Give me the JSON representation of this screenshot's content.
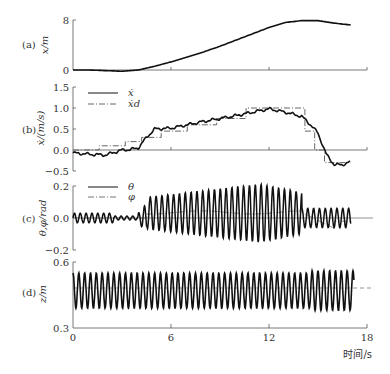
{
  "chart_data": [
    {
      "id": "a",
      "panel_label": "(a)",
      "type": "line",
      "ylabel": "x/m",
      "ylim": [
        0,
        8
      ],
      "yticks": [
        0,
        8
      ],
      "xlim": [
        0,
        18
      ],
      "series": [
        {
          "name": "x",
          "style": "solid",
          "x": [
            0,
            1,
            2,
            3,
            4,
            5,
            6,
            7,
            8,
            9,
            10,
            11,
            12,
            13,
            14,
            15,
            16,
            17
          ],
          "values": [
            0,
            0,
            -0.1,
            -0.2,
            0,
            0.6,
            1.3,
            2.1,
            2.9,
            3.8,
            4.8,
            5.8,
            6.8,
            7.6,
            7.9,
            7.9,
            7.5,
            7.2
          ]
        }
      ]
    },
    {
      "id": "b",
      "panel_label": "(b)",
      "type": "line",
      "ylabel": "ẋ/(m/s)",
      "ylim": [
        -0.5,
        1.5
      ],
      "yticks": [
        -0.5,
        0.0,
        0.5,
        1.0,
        1.5
      ],
      "xlim": [
        0,
        18
      ],
      "series": [
        {
          "name": "ẋ",
          "style": "solid",
          "x": [
            0,
            1,
            2,
            3,
            3.5,
            4,
            4.5,
            5,
            6,
            7,
            8,
            9,
            10,
            11,
            12,
            13,
            14,
            14.5,
            15,
            15.5,
            16,
            16.5,
            17
          ],
          "values": [
            -0.07,
            -0.1,
            -0.12,
            0.0,
            0.01,
            0.05,
            0.3,
            0.5,
            0.52,
            0.6,
            0.68,
            0.75,
            0.82,
            0.9,
            0.98,
            0.9,
            0.8,
            0.62,
            0.4,
            -0.1,
            -0.35,
            -0.35,
            -0.28
          ]
        },
        {
          "name": "ẋd",
          "style": "dashdot",
          "x": [
            0,
            1.6,
            1.6,
            3.2,
            3.2,
            4.2,
            4.2,
            5.4,
            5.4,
            7.0,
            7.0,
            8.8,
            8.8,
            10.6,
            10.6,
            14.2,
            14.2,
            14.8,
            14.8,
            15.4,
            15.4,
            17
          ],
          "values": [
            0,
            0,
            0.1,
            0.1,
            0.2,
            0.2,
            0.3,
            0.3,
            0.45,
            0.45,
            0.6,
            0.6,
            0.75,
            0.75,
            1.0,
            1.0,
            0.45,
            0.45,
            0.0,
            0.0,
            -0.3,
            -0.3
          ]
        }
      ]
    },
    {
      "id": "c",
      "panel_label": "(c)",
      "type": "line",
      "ylabel": "θ,φ/rad",
      "ylim": [
        -0.2,
        0.2
      ],
      "yticks": [
        -0.2,
        0.0,
        0.2
      ],
      "xlim": [
        0,
        18
      ],
      "series": [
        {
          "name": "θ",
          "style": "solid",
          "description": "small oscillation ~±0.03 for t<4s, growing oscillation reaching ~±0.18 around t=11-12s, decaying after t≈14s, irregular until t≈17s"
        },
        {
          "name": "φ",
          "style": "dashdot",
          "description": "slowly varying, near 0, rising to ~0.03-0.05 between 5 and 15s, dipping near 15.5s"
        }
      ]
    },
    {
      "id": "d",
      "panel_label": "(d)",
      "type": "line",
      "ylabel": "z/m",
      "ylim": [
        0.3,
        0.6
      ],
      "yticks": [
        0.3,
        0.6
      ],
      "xlim": [
        0,
        18
      ],
      "xticks": [
        0,
        6,
        12,
        18
      ],
      "xlabel": "时间/s",
      "series": [
        {
          "name": "z",
          "style": "solid",
          "description": "sinusoidal oscillation about 0.47 m with amplitude ~0.08 m (~2.8 Hz), 0 to ~17 s"
        },
        {
          "name": "z_ref",
          "style": "dashed",
          "values_const": 0.47
        }
      ]
    }
  ],
  "axes": {
    "x_ticks": [
      "0",
      "6",
      "12",
      "18"
    ],
    "x_label": "时间/s",
    "a": {
      "label": "(a)",
      "ylabel": "x/m",
      "ticks": [
        "8",
        "0"
      ]
    },
    "b": {
      "label": "(b)",
      "ylabel": "ẋ/(m/s)",
      "ticks": [
        "1.5",
        "1.0",
        "0.5",
        "0.0",
        "−0.5"
      ],
      "legend": [
        "ẋ",
        "ẋd"
      ]
    },
    "c": {
      "label": "(c)",
      "ylabel": "θ,φ/rad",
      "ticks": [
        "0.2",
        "0.0",
        "−0.2"
      ],
      "legend": [
        "θ",
        "φ"
      ]
    },
    "d": {
      "label": "(d)",
      "ylabel": "z/m",
      "ticks": [
        "0.6",
        "0.3"
      ]
    }
  },
  "colors": {
    "line": "#111111",
    "axis": "#555555",
    "ref_line": "#777777"
  }
}
